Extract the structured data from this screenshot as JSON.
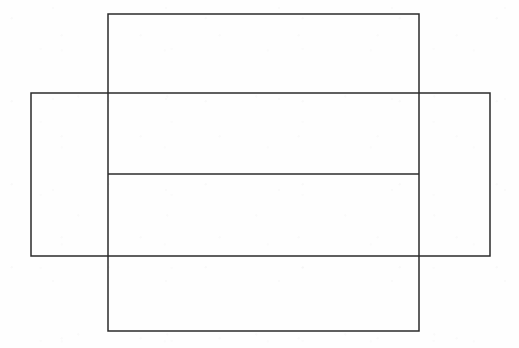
{
  "document": {
    "title": "Overlapping rectangles line figure",
    "kind": "line-drawing",
    "width": 519,
    "height": 348
  },
  "canvas": {
    "background_color": "#fefefe",
    "width": 519,
    "height": 348
  },
  "style": {
    "stroke_color": "#2b2b2b",
    "stroke_width": 1.5,
    "fill": "none"
  },
  "shapes": [
    {
      "id": "vertical-rectangle",
      "name": "tall-rectangle",
      "type": "rect",
      "x": 108,
      "y": 14,
      "width": 311,
      "height": 317,
      "left": 108,
      "top": 14,
      "right": 419,
      "bottom": 331,
      "stroke_color": "#2b2b2b",
      "stroke_width": 1.5,
      "fill": "none"
    },
    {
      "id": "horizontal-rectangle",
      "name": "wide-rectangle",
      "type": "rect",
      "x": 31,
      "y": 93,
      "width": 459,
      "height": 163,
      "left": 31,
      "top": 93,
      "right": 490,
      "bottom": 256,
      "stroke_color": "#2b2b2b",
      "stroke_width": 1.5,
      "fill": "none"
    },
    {
      "id": "interior-divider-line",
      "name": "horizontal-divider-line",
      "type": "line",
      "x1": 108,
      "y1": 174,
      "x2": 419,
      "y2": 174,
      "stroke_color": "#2b2b2b",
      "stroke_width": 1.5
    }
  ],
  "labels": {
    "figure_caption": "",
    "annotations": []
  },
  "accessibility": {
    "description": "A plain line drawing of two overlapping unfilled rectangles: a tall portrait rectangle and a wide landscape rectangle crossing it, plus a horizontal line drawn across the tall rectangle."
  }
}
